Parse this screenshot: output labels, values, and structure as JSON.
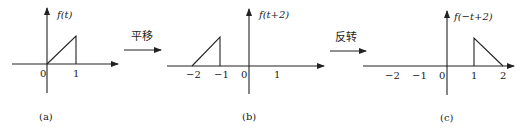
{
  "panels": [
    {
      "id": "a",
      "caption": "(a)",
      "ylabel": "f(t)",
      "ticks": [
        "0",
        "1"
      ],
      "shape": "ramp from (0,0) rising to (1,1), vertical drop at t=1"
    },
    {
      "id": "b",
      "caption": "(b)",
      "ylabel": "f(t+2)",
      "ticks": [
        "−2",
        "−1",
        "0",
        "1"
      ],
      "shape": "ramp from (−2,0) rising to (−1,1), vertical drop at t=−1"
    },
    {
      "id": "c",
      "caption": "(c)",
      "ylabel": "f(−t+2)",
      "ticks": [
        "−2",
        "−1",
        "0",
        "1",
        "2"
      ],
      "shape": "vertical rise at t=1, ramp falling from (1,1) to (2,0)"
    }
  ],
  "arrows": [
    {
      "label": "平移"
    },
    {
      "label": "反转"
    }
  ],
  "colors": {
    "stroke": "#222222",
    "background": "#ffffff"
  }
}
